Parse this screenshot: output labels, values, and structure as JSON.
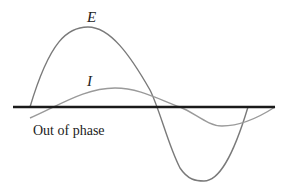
{
  "diagram": {
    "title": "Out of phase",
    "colors": {
      "background": "#ffffff",
      "axis": "#1a1a1a",
      "e_curve": "#7a7a7a",
      "i_curve": "#9a9a9a",
      "text": "#222222"
    },
    "axis": {
      "x1": 13,
      "x2": 275,
      "y": 107
    },
    "curves": [
      {
        "name": "E",
        "label": "E",
        "label_pos": [
          87,
          22
        ],
        "path": "M30,107 C50,40 68,27 88,27 C110,27 130,55 150,90 C160,110 168,145 180,168 C188,180 196,181 204,181 C218,181 232,160 248,107"
      },
      {
        "name": "I",
        "label": "I",
        "label_pos": [
          87,
          86
        ],
        "path": "M30,118 C60,105 85,88 115,88 C140,88 160,100 180,107 C195,113 208,126 222,126 C240,126 258,118 275,107"
      }
    ],
    "caption": {
      "text": "Out of phase",
      "pos": [
        33,
        135
      ]
    }
  }
}
